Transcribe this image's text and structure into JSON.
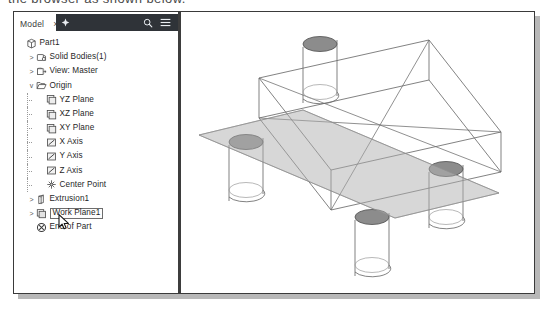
{
  "caption": {
    "text": "the browser as shown below."
  },
  "panel": {
    "tab_label": "Model",
    "close_label": "×",
    "toolbar": {
      "add_icon": "plus-icon",
      "search_icon": "search-icon",
      "menu_icon": "hamburger-menu-icon"
    }
  },
  "tree": {
    "items": [
      {
        "label": "Part1",
        "icon": "part-icon",
        "depth": 0,
        "twisty": "",
        "selected": false
      },
      {
        "label": "Solid Bodies(1)",
        "icon": "solid-bodies-icon",
        "depth": 1,
        "twisty": ">",
        "selected": false
      },
      {
        "label": "View: Master",
        "icon": "view-icon",
        "depth": 1,
        "twisty": ">",
        "selected": false
      },
      {
        "label": "Origin",
        "icon": "folder-icon",
        "depth": 1,
        "twisty": "v",
        "selected": false
      },
      {
        "label": "YZ Plane",
        "icon": "plane-icon",
        "depth": 2,
        "twisty": "",
        "selected": false
      },
      {
        "label": "XZ Plane",
        "icon": "plane-icon",
        "depth": 2,
        "twisty": "",
        "selected": false
      },
      {
        "label": "XY Plane",
        "icon": "plane-icon",
        "depth": 2,
        "twisty": "",
        "selected": false
      },
      {
        "label": "X Axis",
        "icon": "axis-icon",
        "depth": 2,
        "twisty": "",
        "selected": false
      },
      {
        "label": "Y Axis",
        "icon": "axis-icon",
        "depth": 2,
        "twisty": "",
        "selected": false
      },
      {
        "label": "Z Axis",
        "icon": "axis-icon",
        "depth": 2,
        "twisty": "",
        "selected": false
      },
      {
        "label": "Center Point",
        "icon": "center-point-icon",
        "depth": 2,
        "twisty": "",
        "selected": false
      },
      {
        "label": "Extrusion1",
        "icon": "extrusion-icon",
        "depth": 1,
        "twisty": ">",
        "selected": false
      },
      {
        "label": "Work Plane1",
        "icon": "work-plane-icon",
        "depth": 1,
        "twisty": ">",
        "selected": true
      },
      {
        "label": "End of Part",
        "icon": "end-of-part-icon",
        "depth": 1,
        "twisty": "",
        "selected": false
      }
    ]
  },
  "viewport": {
    "name": "3d-model-viewport",
    "model_name": "Part1",
    "cursor_icon": "mouse-pointer-icon",
    "colors": {
      "edge": "#6b6b6b",
      "work_plane_fill": "#c9c9c9",
      "hole_top_fill": "#8c8c8c",
      "toolbar_dark": "#2f3338"
    }
  }
}
